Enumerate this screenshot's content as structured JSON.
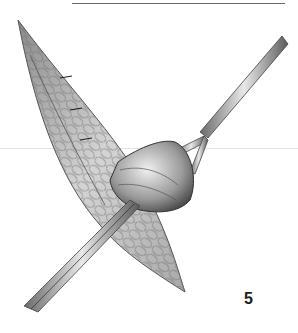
{
  "figure": {
    "number": "5",
    "elements": [
      "leaf-shaped-incision-icon",
      "forceps-icon",
      "retractor-icon",
      "tissue-sac-icon"
    ]
  },
  "colors": {
    "background": "#ffffff",
    "ink": "#1a1a1a",
    "tissue_light": "#d9d9d9",
    "tissue_mid": "#9a9a9a",
    "tissue_dark": "#4a4a4a",
    "rule": "#6a6a6a"
  }
}
